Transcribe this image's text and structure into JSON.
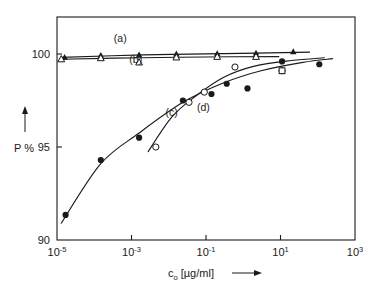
{
  "chart_data": {
    "type": "scatter",
    "title": "",
    "xlabel": "c_o [µg/ml]",
    "xlabel_base": "c",
    "xlabel_sub": "o",
    "xlabel_rest": " [µg/ml]",
    "ylabel": "P %",
    "xscale": "log",
    "xlim": [
      1e-05,
      1000
    ],
    "ylim": [
      90,
      100.8
    ],
    "grid": false,
    "legend": "inline-curve-labels",
    "xticks": [
      {
        "value": 1e-05,
        "mantissa": "10",
        "exponent": "-5"
      },
      {
        "value": 0.001,
        "mantissa": "10",
        "exponent": "-3"
      },
      {
        "value": 0.1,
        "mantissa": "10",
        "exponent": "-1"
      },
      {
        "value": 10,
        "mantissa": "10",
        "exponent": "1"
      },
      {
        "value": 1000,
        "mantissa": "10",
        "exponent": "3"
      }
    ],
    "yticks": [
      {
        "value": 90,
        "label": "90"
      },
      {
        "value": 95,
        "label": "95"
      },
      {
        "value": 100,
        "label": "100"
      }
    ],
    "series": [
      {
        "name": "a",
        "label": "(a)",
        "marker": "filled-triangle",
        "label_x": 0.0005,
        "label_y": 100.62,
        "points": [
          {
            "x": 1.6e-05,
            "y": 99.82
          },
          {
            "x": 0.00015,
            "y": 99.93
          },
          {
            "x": 0.0016,
            "y": 99.95
          },
          {
            "x": 0.016,
            "y": 100.0
          },
          {
            "x": 0.2,
            "y": 100.02
          },
          {
            "x": 2.2,
            "y": 100.05
          },
          {
            "x": 22.0,
            "y": 100.12
          }
        ],
        "curve": [
          {
            "x": 1.3e-05,
            "y": 99.82
          },
          {
            "x": 0.002,
            "y": 99.95
          },
          {
            "x": 0.3,
            "y": 100.02
          },
          {
            "x": 60.0,
            "y": 100.1
          }
        ]
      },
      {
        "name": "b",
        "label": "(b)",
        "marker": "open-triangle",
        "label_x": 0.0013,
        "label_y": 99.52,
        "points": [
          {
            "x": 1.3e-05,
            "y": 99.72
          },
          {
            "x": 0.00015,
            "y": 99.78
          },
          {
            "x": 0.0016,
            "y": 99.55
          },
          {
            "x": 0.016,
            "y": 99.82
          },
          {
            "x": 0.2,
            "y": 99.85
          },
          {
            "x": 2.2,
            "y": 99.85
          }
        ],
        "curve": [
          {
            "x": 1.3e-05,
            "y": 99.72
          },
          {
            "x": 0.002,
            "y": 99.8
          },
          {
            "x": 0.5,
            "y": 99.85
          },
          {
            "x": 9.0,
            "y": 99.86
          }
        ]
      },
      {
        "name": "c",
        "label": "(c)",
        "marker": "filled-circle",
        "label_x": 0.012,
        "label_y": 96.65,
        "points": [
          {
            "x": 1.7e-05,
            "y": 91.35
          },
          {
            "x": 0.00015,
            "y": 94.3
          },
          {
            "x": 0.0016,
            "y": 95.5
          },
          {
            "x": 0.024,
            "y": 97.5
          },
          {
            "x": 0.14,
            "y": 97.85
          },
          {
            "x": 0.36,
            "y": 98.4
          },
          {
            "x": 1.3,
            "y": 98.15
          },
          {
            "x": 11.0,
            "y": 99.6
          },
          {
            "x": 110.0,
            "y": 99.45
          }
        ],
        "curve": [
          {
            "x": 1.3e-05,
            "y": 90.9
          },
          {
            "x": 0.00015,
            "y": 94.1
          },
          {
            "x": 0.0016,
            "y": 95.75
          },
          {
            "x": 0.024,
            "y": 97.4
          },
          {
            "x": 0.3,
            "y": 98.45
          },
          {
            "x": 3.0,
            "y": 99.1
          },
          {
            "x": 40.0,
            "y": 99.55
          },
          {
            "x": 250.0,
            "y": 99.75
          }
        ]
      },
      {
        "name": "d",
        "label": "(d)",
        "marker": "open-circle",
        "label_x": 0.085,
        "label_y": 96.95,
        "points": [
          {
            "x": 0.0045,
            "y": 95.0
          },
          {
            "x": 0.035,
            "y": 97.4
          },
          {
            "x": 0.09,
            "y": 97.95
          },
          {
            "x": 0.6,
            "y": 99.3
          },
          {
            "x": 11.0,
            "y": 99.1
          }
        ],
        "curve": [
          {
            "x": 0.0028,
            "y": 94.75
          },
          {
            "x": 0.012,
            "y": 96.6
          },
          {
            "x": 0.05,
            "y": 97.7
          },
          {
            "x": 0.3,
            "y": 98.75
          },
          {
            "x": 2.0,
            "y": 99.35
          },
          {
            "x": 20.0,
            "y": 99.65
          },
          {
            "x": 150.0,
            "y": 99.8
          }
        ]
      }
    ],
    "extra_points": [
      {
        "x": 11.0,
        "y": 99.1,
        "marker": "open-square",
        "series": "b"
      }
    ]
  },
  "axes": {
    "y_axis_title": "P %",
    "y_arrow": "up-arrow",
    "x_arrow": "right-arrow"
  }
}
